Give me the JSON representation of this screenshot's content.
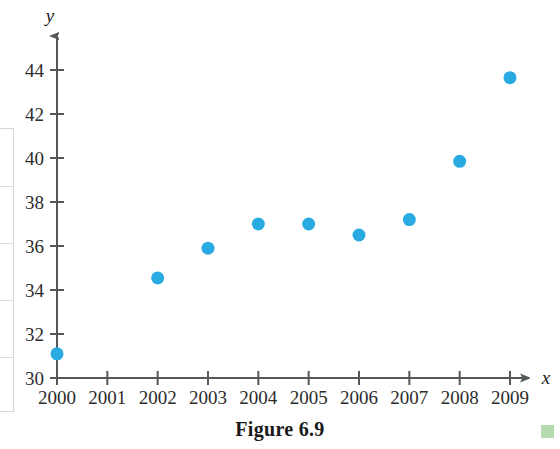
{
  "figure": {
    "caption": "Figure 6.9",
    "marker_color": "#29abe2",
    "axis_color": "#55595c",
    "text_color": "#2c2c2c"
  },
  "chart_data": {
    "type": "scatter",
    "title": "",
    "xlabel": "x",
    "ylabel": "y",
    "xlim": [
      2000,
      2009
    ],
    "ylim": [
      30,
      45
    ],
    "grid": false,
    "legend": null,
    "x_tick_labels": [
      "2000",
      "2001",
      "2002",
      "2003",
      "2004",
      "2005",
      "2006",
      "2007",
      "2008",
      "2009"
    ],
    "y_tick_labels": [
      "30",
      "32",
      "34",
      "36",
      "38",
      "40",
      "42",
      "44"
    ],
    "x_ticks": [
      2000,
      2001,
      2002,
      2003,
      2004,
      2005,
      2006,
      2007,
      2008,
      2009
    ],
    "y_ticks": [
      30,
      32,
      34,
      36,
      38,
      40,
      42,
      44
    ],
    "points": [
      {
        "x": 2000,
        "y": 31.1
      },
      {
        "x": 2002,
        "y": 34.55
      },
      {
        "x": 2003,
        "y": 35.9
      },
      {
        "x": 2004,
        "y": 37.0
      },
      {
        "x": 2005,
        "y": 37.0
      },
      {
        "x": 2006,
        "y": 36.5
      },
      {
        "x": 2007,
        "y": 37.2
      },
      {
        "x": 2008,
        "y": 39.85
      },
      {
        "x": 2009,
        "y": 43.65
      }
    ]
  }
}
